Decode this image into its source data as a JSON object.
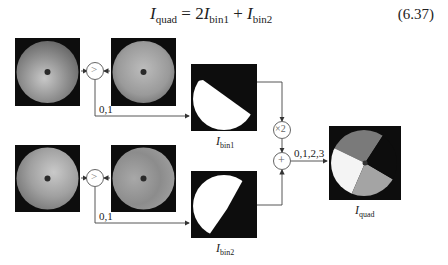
{
  "equation": {
    "lhs_symbol": "I",
    "lhs_sub": "quad",
    "equals": " = 2",
    "term1_symbol": "I",
    "term1_sub": "bin1",
    "plus": " + ",
    "term2_symbol": "I",
    "term2_sub": "bin2",
    "number": "(6.37)"
  },
  "diagram": {
    "row1": {
      "input_a": "phase-image-1a",
      "input_b": "phase-image-1b",
      "comparator_symbol": ">",
      "edge_label": "0,1",
      "output_label_symbol": "I",
      "output_label_sub": "bin1"
    },
    "row2": {
      "input_a": "phase-image-2a",
      "input_b": "phase-image-2b",
      "comparator_symbol": ">",
      "edge_label": "0,1",
      "output_label_symbol": "I",
      "output_label_sub": "bin2"
    },
    "multiplier_symbol": "×2",
    "adder_symbol": "+",
    "sum_edge_label": "0,1,2,3",
    "result_label_symbol": "I",
    "result_label_sub": "quad"
  }
}
